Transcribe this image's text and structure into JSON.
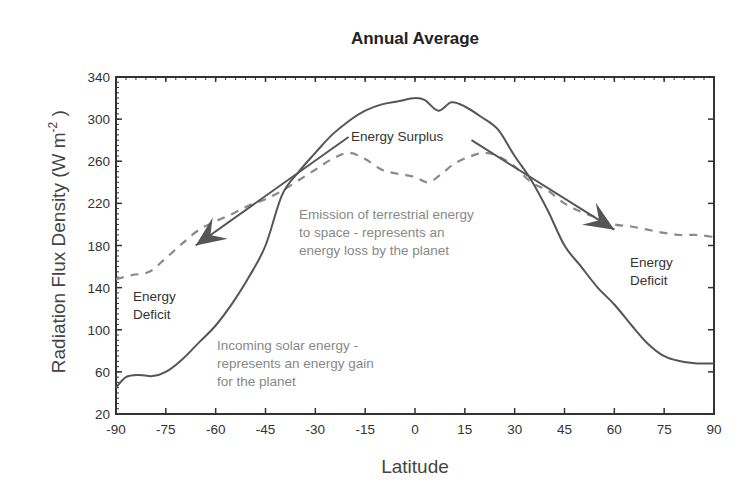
{
  "chart_data": {
    "type": "line",
    "title": "Annual Average",
    "xlabel": "Latitude",
    "ylabel": "Radiation Flux Density (W m⁻² )",
    "xlim": [
      -90,
      90
    ],
    "ylim": [
      20,
      340
    ],
    "xticks": [
      -90,
      -75,
      -60,
      -45,
      -30,
      -15,
      0,
      15,
      30,
      45,
      60,
      75,
      90
    ],
    "yticks": [
      20,
      60,
      100,
      140,
      180,
      220,
      260,
      300,
      340
    ],
    "grid": false,
    "legend": null,
    "series": [
      {
        "name": "Incoming solar energy",
        "style": "solid",
        "x": [
          -90,
          -87,
          -83,
          -79,
          -75,
          -70,
          -65,
          -60,
          -55,
          -50,
          -45,
          -40,
          -35,
          -30,
          -25,
          -20,
          -15,
          -10,
          -5,
          0,
          3,
          7,
          11,
          15,
          20,
          25,
          30,
          35,
          40,
          45,
          50,
          55,
          60,
          65,
          70,
          75,
          80,
          85,
          90
        ],
        "values": [
          45,
          55,
          57,
          56,
          60,
          72,
          88,
          104,
          125,
          150,
          180,
          228,
          250,
          268,
          285,
          298,
          308,
          314,
          317,
          320,
          318,
          308,
          316,
          312,
          302,
          290,
          265,
          242,
          213,
          180,
          160,
          140,
          124,
          105,
          87,
          75,
          70,
          68,
          68
        ]
      },
      {
        "name": "Emission of terrestrial energy to space",
        "style": "dashed",
        "x": [
          -90,
          -85,
          -80,
          -75,
          -70,
          -65,
          -60,
          -55,
          -50,
          -45,
          -40,
          -35,
          -30,
          -25,
          -20,
          -15,
          -10,
          -5,
          0,
          4,
          8,
          12,
          17,
          21,
          25,
          30,
          35,
          40,
          45,
          50,
          55,
          60,
          65,
          70,
          75,
          80,
          85,
          90
        ],
        "values": [
          148,
          152,
          155,
          168,
          182,
          195,
          203,
          210,
          218,
          224,
          232,
          242,
          252,
          262,
          268,
          262,
          252,
          248,
          245,
          240,
          248,
          258,
          265,
          268,
          265,
          255,
          240,
          232,
          220,
          212,
          206,
          200,
          198,
          195,
          192,
          190,
          190,
          188
        ]
      }
    ],
    "annotations": [
      {
        "text": "Energy Surplus",
        "x": -5,
        "y": 285
      },
      {
        "text": "Energy Deficit",
        "x": -83,
        "y": 130
      },
      {
        "text": "Energy Deficit",
        "x": 67,
        "y": 150
      },
      {
        "text": "Emission of terrestrial energy to space - represents an energy loss by the planet",
        "x": -5,
        "y": 210
      },
      {
        "text": "Incoming solar energy - represents an energy gain for the planet",
        "x": -48,
        "y": 70
      }
    ],
    "arrows": [
      {
        "from": [
          -20,
          283
        ],
        "to": [
          -66,
          180
        ],
        "label": "left deficit arrow"
      },
      {
        "from": [
          17,
          280
        ],
        "to": [
          60,
          195
        ],
        "label": "right deficit arrow"
      }
    ]
  },
  "labels": {
    "title": "Annual Average",
    "xlabel": "Latitude",
    "ylabel_main": "Radiation Flux Density (W m",
    "ylabel_sup": "-2",
    "ylabel_end": " )",
    "surplus": "Energy Surplus",
    "deficit_left_1": "Energy",
    "deficit_left_2": "Deficit",
    "deficit_right_1": "Energy",
    "deficit_right_2": "Deficit",
    "emission_1": "Emission of terrestrial energy",
    "emission_2": "to space - represents an",
    "emission_3": "energy loss by the planet",
    "incoming_1": "Incoming solar energy -",
    "incoming_2": "represents an energy gain",
    "incoming_3": "for the planet"
  },
  "colors": {
    "solid_line": "#555555",
    "dashed_line": "#8a8a8a",
    "arrow": "#555555",
    "axis": "#333333"
  }
}
